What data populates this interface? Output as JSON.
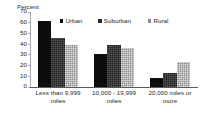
{
  "chart_data": {
    "type": "bar",
    "title": "",
    "subtitle": "",
    "xlabel": "",
    "ylabel": "Percent",
    "ylim": [
      0,
      70
    ],
    "yticks": [
      70,
      60,
      50,
      40,
      30,
      20,
      10,
      0
    ],
    "grid": false,
    "legend_position": "top",
    "categories": [
      "Less than 9,999 miles",
      "10,000 - 19,999 miles",
      "20,000 miles or more"
    ],
    "series": [
      {
        "name": "Urban",
        "color": "#0d0d0d",
        "values": [
          61,
          30,
          8
        ]
      },
      {
        "name": "Suburban",
        "color": "#262626",
        "values": [
          45,
          39,
          13
        ]
      },
      {
        "name": "Rural",
        "color": "#8c8c8c",
        "values": [
          39,
          36,
          23
        ]
      }
    ]
  },
  "axis": {
    "y_title": "Percent",
    "y_tick_labels": [
      "70",
      "60",
      "50",
      "40",
      "30",
      "20",
      "10",
      "0"
    ]
  },
  "legend": {
    "items": [
      {
        "label": "Urban"
      },
      {
        "label": "Suburban"
      },
      {
        "label": "Rural"
      }
    ]
  },
  "x_axis": {
    "labels": [
      {
        "line1": "Less than 9,999",
        "line2": "miles"
      },
      {
        "line1": "10,000 - 19,999",
        "line2": "miles"
      },
      {
        "line1": "20,000 miles or",
        "line2": "more"
      }
    ]
  }
}
